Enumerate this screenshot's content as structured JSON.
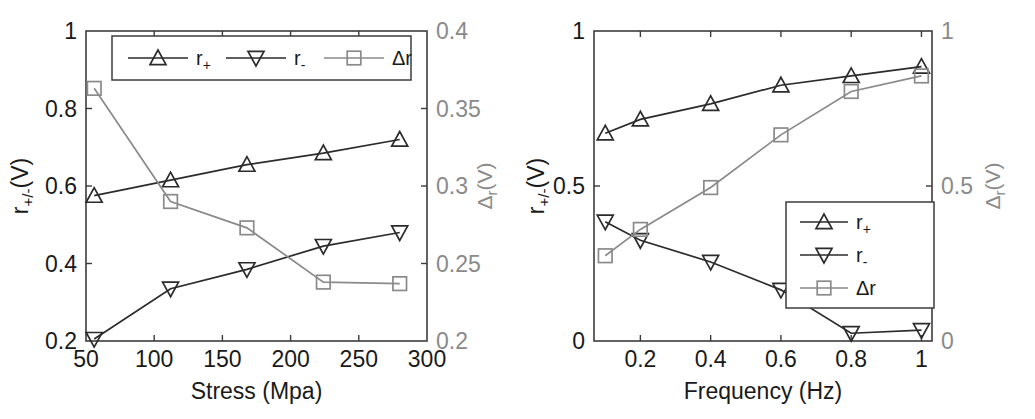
{
  "figure": {
    "background_color": "#ffffff",
    "panels": [
      "stress-panel",
      "frequency-panel"
    ]
  },
  "colors": {
    "series_r_plus": "#2b2b2b",
    "series_r_minus": "#2b2b2b",
    "series_delta_r": "#8a8a8a",
    "axis": "#3c3c3c",
    "left_axis_text": "#1a1a1a",
    "right_axis_text": "#8a8a8a"
  },
  "panel_left": {
    "name": "stress-panel",
    "xlabel": "Stress (Mpa)",
    "ylabel_left_main": "r",
    "ylabel_left_sub": "+/-",
    "ylabel_left_tail": "(V)",
    "ylabel_right_main": "Δ",
    "ylabel_right_sub": "r",
    "ylabel_right_tail": "(V)",
    "xticks": [
      "50",
      "100",
      "150",
      "200",
      "250",
      "300"
    ],
    "yticks_left": [
      "0.2",
      "0.4",
      "0.6",
      "0.8",
      "1"
    ],
    "yticks_right": [
      "0.2",
      "0.25",
      "0.3",
      "0.35",
      "0.4"
    ],
    "legend": {
      "orientation": "horizontal",
      "position": "top-center",
      "entries": [
        {
          "label_main": "r",
          "label_sub": "+",
          "marker": "triangle-up-icon",
          "color": "#2b2b2b"
        },
        {
          "label_main": "r",
          "label_sub": "-",
          "marker": "triangle-down-icon",
          "color": "#2b2b2b"
        },
        {
          "label_main": "Δr",
          "label_sub": "",
          "marker": "square-icon",
          "color": "#8a8a8a"
        }
      ]
    }
  },
  "panel_right": {
    "name": "frequency-panel",
    "xlabel": "Frequency (Hz)",
    "ylabel_left_main": "r",
    "ylabel_left_sub": "+/-",
    "ylabel_left_tail": "(V)",
    "ylabel_right_main": "Δ",
    "ylabel_right_sub": "r",
    "ylabel_right_tail": "(V)",
    "xticks": [
      "0.2",
      "0.4",
      "0.6",
      "0.8",
      "1"
    ],
    "yticks_left": [
      "0",
      "0.5",
      "1"
    ],
    "yticks_right": [
      "0",
      "0.5",
      "1"
    ],
    "legend": {
      "orientation": "vertical",
      "position": "bottom-right",
      "entries": [
        {
          "label_main": "r",
          "label_sub": "+",
          "marker": "triangle-up-icon",
          "color": "#2b2b2b"
        },
        {
          "label_main": "r",
          "label_sub": "-",
          "marker": "triangle-down-icon",
          "color": "#2b2b2b"
        },
        {
          "label_main": "Δr",
          "label_sub": "",
          "marker": "square-icon",
          "color": "#8a8a8a"
        }
      ]
    }
  },
  "chart_data": [
    {
      "id": "stress-panel",
      "type": "line",
      "title": "",
      "xlabel": "Stress (Mpa)",
      "ylabel": "r+/-(V)",
      "ylabel_right": "Δr(V)",
      "x": [
        56,
        112,
        168,
        224,
        280
      ],
      "xlim": [
        50,
        300
      ],
      "ylim": [
        0.2,
        1
      ],
      "ylim_right": [
        0.2,
        0.4
      ],
      "xticks": [
        50,
        100,
        150,
        200,
        250,
        300
      ],
      "yticks": [
        0.2,
        0.4,
        0.6,
        0.8,
        1
      ],
      "yticks_right": [
        0.2,
        0.25,
        0.3,
        0.35,
        0.4
      ],
      "grid": false,
      "legend_position": "top-center",
      "series": [
        {
          "name": "r+",
          "axis": "left",
          "marker": "triangle-up",
          "color": "#2b2b2b",
          "values": [
            0.575,
            0.615,
            0.655,
            0.685,
            0.72
          ]
        },
        {
          "name": "r-",
          "axis": "left",
          "marker": "triangle-down",
          "color": "#2b2b2b",
          "values": [
            0.205,
            0.335,
            0.385,
            0.445,
            0.48
          ]
        },
        {
          "name": "Δr",
          "axis": "right",
          "marker": "square",
          "color": "#8a8a8a",
          "values": [
            0.363,
            0.29,
            0.273,
            0.238,
            0.237
          ]
        }
      ]
    },
    {
      "id": "frequency-panel",
      "type": "line",
      "title": "",
      "xlabel": "Frequency (Hz)",
      "ylabel": "r+/-(V)",
      "ylabel_right": "Δr(V)",
      "x": [
        0.1,
        0.2,
        0.4,
        0.6,
        0.8,
        1.0
      ],
      "xlim": [
        0.068,
        1.03
      ],
      "ylim": [
        0,
        1
      ],
      "ylim_right": [
        0,
        1
      ],
      "xticks": [
        0.2,
        0.4,
        0.6,
        0.8,
        1
      ],
      "yticks": [
        0,
        0.5,
        1
      ],
      "yticks_right": [
        0,
        0.5,
        1
      ],
      "grid": false,
      "legend_position": "bottom-right",
      "series": [
        {
          "name": "r+",
          "axis": "left",
          "marker": "triangle-up",
          "color": "#2b2b2b",
          "values": [
            0.67,
            0.715,
            0.765,
            0.825,
            0.855,
            0.885
          ]
        },
        {
          "name": "r-",
          "axis": "left",
          "marker": "triangle-down",
          "color": "#2b2b2b",
          "values": [
            0.385,
            0.325,
            0.255,
            0.165,
            0.025,
            0.035
          ]
        },
        {
          "name": "Δr",
          "axis": "right",
          "marker": "square",
          "color": "#8a8a8a",
          "values": [
            0.275,
            0.36,
            0.495,
            0.665,
            0.805,
            0.855
          ]
        }
      ]
    }
  ]
}
